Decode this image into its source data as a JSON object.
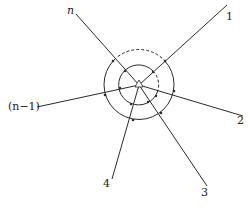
{
  "diagram": {
    "center": [
      139,
      85
    ],
    "outer_radius": 35,
    "inner_radius": 20,
    "branches": [
      {
        "id": "n",
        "label": "n",
        "end": [
          76,
          14
        ]
      },
      {
        "id": "1",
        "label": "1",
        "end": [
          227,
          5
        ]
      },
      {
        "id": "2",
        "label": "2",
        "end": [
          243,
          116
        ]
      },
      {
        "id": "3",
        "label": "3",
        "end": [
          207,
          186
        ]
      },
      {
        "id": "4",
        "label": "4",
        "end": [
          112,
          179
        ]
      },
      {
        "id": "n-1",
        "label": "(n−1)",
        "end": [
          37,
          107
        ]
      }
    ],
    "labels": {
      "n": "n",
      "one": "1",
      "two": "2",
      "three": "3",
      "four": "4",
      "n_minus_1": "(n−1)"
    },
    "line_color": "#2b2b2b"
  }
}
